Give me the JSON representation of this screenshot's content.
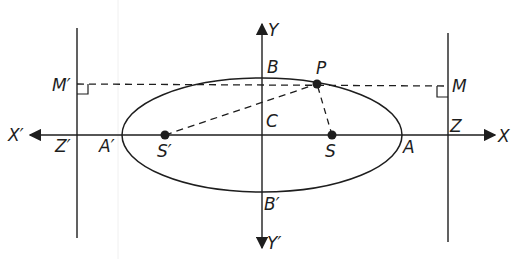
{
  "diagram": {
    "colors": {
      "ink": "#1e1e1e",
      "background": "#ffffff"
    },
    "labels": {
      "X": "X",
      "X_prime": "X′",
      "Y": "Y",
      "Y_prime": "Y′",
      "C": "C",
      "A": "A",
      "A_prime": "A′",
      "B": "B",
      "B_prime": "B′",
      "S": "S",
      "S_prime": "S′",
      "P": "P",
      "M": "M",
      "M_prime": "M′",
      "Z": "Z",
      "Z_prime": "Z′"
    },
    "elements": {
      "ellipse": {
        "center": [
          262,
          135
        ],
        "rx": 140,
        "ry": 57
      },
      "x_axis": {
        "from": [
          28,
          135
        ],
        "to": [
          497,
          135
        ]
      },
      "y_axis": {
        "from": [
          262,
          22
        ],
        "to": [
          262,
          250
        ]
      },
      "directrix_left": {
        "x": 77,
        "y_from": 28,
        "y_to": 238
      },
      "directrix_right": {
        "x": 448,
        "y_from": 33,
        "y_to": 242
      },
      "focus_S": [
        332,
        135
      ],
      "focus_S_prime": [
        165,
        135
      ],
      "point_P": [
        317,
        84
      ],
      "foot_M": [
        448,
        85
      ],
      "foot_M_prime": [
        77,
        84
      ],
      "dashed_segments": [
        "M′–M through P",
        "S′–P",
        "S–P"
      ]
    }
  }
}
